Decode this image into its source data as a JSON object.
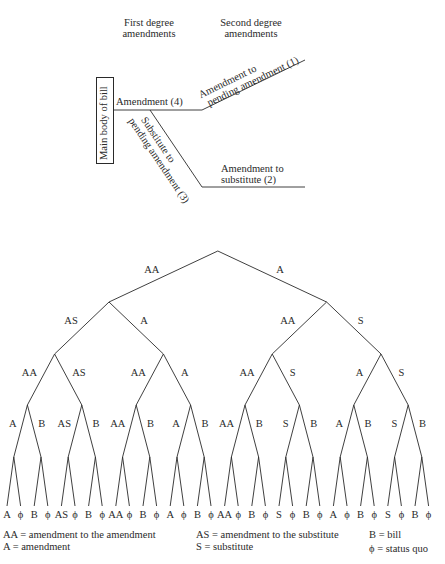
{
  "upper_diagram": {
    "headers": {
      "first_degree": [
        "First degree",
        "amendments"
      ],
      "second_degree": [
        "Second degree",
        "amendments"
      ]
    },
    "main_body_label": "Main body of bill",
    "amendment_label": "Amendment (4)",
    "amendment_to_pending": [
      "Amendment to",
      "pending amendment (1)"
    ],
    "substitute_to_pending": [
      "Substitute to",
      "pending amendment (3)"
    ],
    "amendment_to_substitute": [
      "Amendment to",
      "substitute (2)"
    ]
  },
  "tree": {
    "level1": [
      "AA",
      "A"
    ],
    "level2": [
      "AS",
      "A",
      "AA",
      "S"
    ],
    "level3": [
      "AA",
      "AS",
      "AA",
      "A",
      "AA",
      "S",
      "A",
      "S"
    ],
    "level4": [
      "A",
      "B",
      "AS",
      "B",
      "AA",
      "B",
      "A",
      "B",
      "AA",
      "B",
      "S",
      "B",
      "A",
      "B",
      "S",
      "B"
    ],
    "leaves": [
      "A",
      "ϕ",
      "B",
      "ϕ",
      "AS",
      "ϕ",
      "B",
      "ϕ",
      "AA",
      "ϕ",
      "B",
      "ϕ",
      "A",
      "ϕ",
      "B",
      "ϕ",
      "AA",
      "ϕ",
      "B",
      "ϕ",
      "S",
      "ϕ",
      "B",
      "ϕ",
      "A",
      "ϕ",
      "B",
      "ϕ",
      "S",
      "ϕ",
      "B",
      "ϕ"
    ]
  },
  "legend": {
    "aa": "AA = amendment to the amendment",
    "a": "A = amendment",
    "as": "AS = amendment to the substitute",
    "s": "S = substitute",
    "b": "B = bill",
    "phi": "ϕ = status quo"
  }
}
